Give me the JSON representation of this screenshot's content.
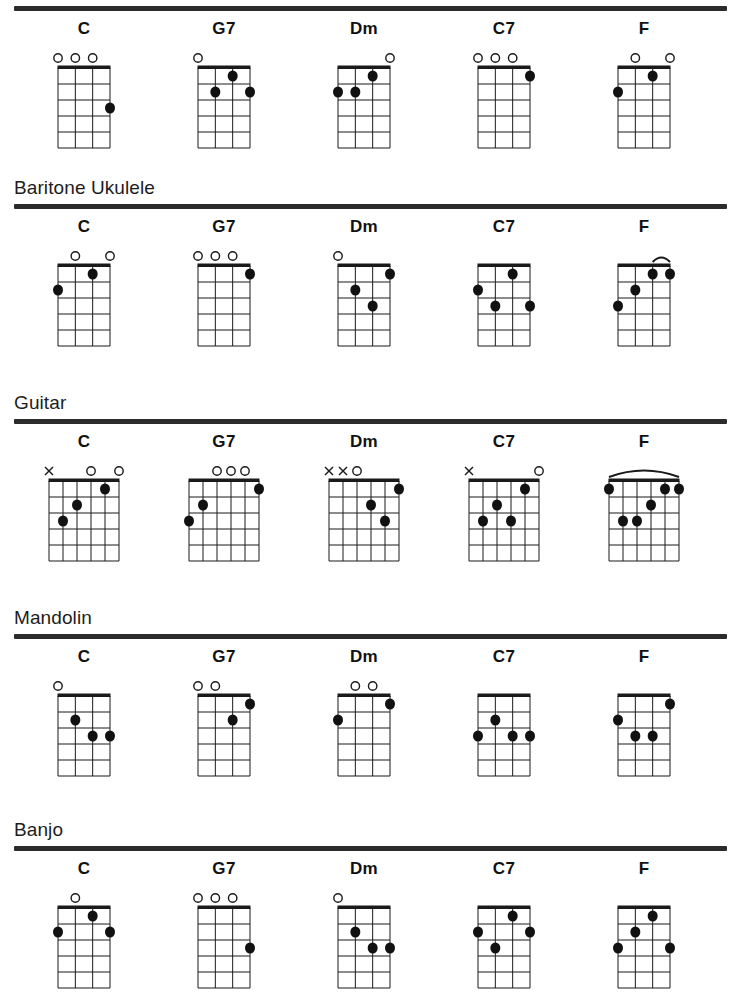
{
  "page": {
    "ink_color": "#1a1a1a",
    "paper_color": "#ffffff"
  },
  "markers": {
    "open_symbol": "O",
    "muted_symbol": "X",
    "open_name": "open-string-circle",
    "muted_name": "muted-string-cross",
    "barre_name": "barre-arc"
  },
  "chart_data": {
    "type": "table",
    "chords": [
      "C",
      "G7",
      "Dm",
      "C7",
      "F"
    ],
    "sections": [
      {
        "label": "",
        "show_label": false,
        "instrument": "Ukulele",
        "strings": 4,
        "frets": 5,
        "width": 52,
        "height": 80,
        "chords": [
          {
            "name": "C",
            "markers": [
              "o",
              "o",
              "o",
              ""
            ],
            "dots": [
              {
                "string": 4,
                "fret": 3
              }
            ],
            "barre": null
          },
          {
            "name": "G7",
            "markers": [
              "o",
              "",
              "",
              ""
            ],
            "dots": [
              {
                "string": 3,
                "fret": 1
              },
              {
                "string": 2,
                "fret": 2
              },
              {
                "string": 4,
                "fret": 2
              }
            ],
            "barre": null
          },
          {
            "name": "Dm",
            "markers": [
              "",
              "",
              "",
              "o"
            ],
            "dots": [
              {
                "string": 3,
                "fret": 1
              },
              {
                "string": 1,
                "fret": 2
              },
              {
                "string": 2,
                "fret": 2
              }
            ],
            "barre": null
          },
          {
            "name": "C7",
            "markers": [
              "o",
              "o",
              "o",
              ""
            ],
            "dots": [
              {
                "string": 4,
                "fret": 1
              }
            ],
            "barre": null
          },
          {
            "name": "F",
            "markers": [
              "",
              "o",
              "",
              "o"
            ],
            "dots": [
              {
                "string": 3,
                "fret": 1
              },
              {
                "string": 1,
                "fret": 2
              }
            ],
            "barre": null
          }
        ]
      },
      {
        "label": "Baritone Ukulele",
        "show_label": true,
        "instrument": "Baritone Ukulele",
        "strings": 4,
        "frets": 5,
        "width": 52,
        "height": 80,
        "chords": [
          {
            "name": "C",
            "markers": [
              "",
              "o",
              "",
              "o"
            ],
            "dots": [
              {
                "string": 3,
                "fret": 1
              },
              {
                "string": 1,
                "fret": 2
              }
            ],
            "barre": null
          },
          {
            "name": "G7",
            "markers": [
              "o",
              "o",
              "o",
              ""
            ],
            "dots": [
              {
                "string": 4,
                "fret": 1
              }
            ],
            "barre": null
          },
          {
            "name": "Dm",
            "markers": [
              "o",
              "",
              "",
              ""
            ],
            "dots": [
              {
                "string": 4,
                "fret": 1
              },
              {
                "string": 2,
                "fret": 2
              },
              {
                "string": 3,
                "fret": 3
              }
            ],
            "barre": null
          },
          {
            "name": "C7",
            "markers": [
              "",
              "",
              "",
              ""
            ],
            "dots": [
              {
                "string": 3,
                "fret": 1
              },
              {
                "string": 1,
                "fret": 2
              },
              {
                "string": 2,
                "fret": 3
              },
              {
                "string": 4,
                "fret": 3
              }
            ],
            "barre": null
          },
          {
            "name": "F",
            "markers": [
              "",
              "",
              "",
              ""
            ],
            "dots": [
              {
                "string": 3,
                "fret": 1
              },
              {
                "string": 4,
                "fret": 1
              },
              {
                "string": 2,
                "fret": 2
              },
              {
                "string": 1,
                "fret": 3
              }
            ],
            "barre": {
              "fret": 1,
              "from": 3,
              "to": 4
            }
          }
        ]
      },
      {
        "label": "Guitar",
        "show_label": true,
        "instrument": "Guitar",
        "strings": 6,
        "frets": 5,
        "width": 70,
        "height": 80,
        "chords": [
          {
            "name": "C",
            "markers": [
              "x",
              "",
              "",
              "o",
              "",
              "o"
            ],
            "dots": [
              {
                "string": 5,
                "fret": 1
              },
              {
                "string": 3,
                "fret": 2
              },
              {
                "string": 2,
                "fret": 3
              }
            ],
            "barre": null
          },
          {
            "name": "G7",
            "markers": [
              "",
              "",
              "o",
              "o",
              "o",
              ""
            ],
            "dots": [
              {
                "string": 6,
                "fret": 1
              },
              {
                "string": 2,
                "fret": 2
              },
              {
                "string": 1,
                "fret": 3
              }
            ],
            "barre": null
          },
          {
            "name": "Dm",
            "markers": [
              "x",
              "x",
              "o",
              "",
              "",
              ""
            ],
            "dots": [
              {
                "string": 6,
                "fret": 1
              },
              {
                "string": 4,
                "fret": 2
              },
              {
                "string": 5,
                "fret": 3
              }
            ],
            "barre": null
          },
          {
            "name": "C7",
            "markers": [
              "x",
              "",
              "",
              "",
              "",
              "o"
            ],
            "dots": [
              {
                "string": 5,
                "fret": 1
              },
              {
                "string": 3,
                "fret": 2
              },
              {
                "string": 2,
                "fret": 3
              },
              {
                "string": 4,
                "fret": 3
              }
            ],
            "barre": null
          },
          {
            "name": "F",
            "markers": [
              "",
              "",
              "",
              "",
              "",
              ""
            ],
            "dots": [
              {
                "string": 1,
                "fret": 1
              },
              {
                "string": 5,
                "fret": 1
              },
              {
                "string": 6,
                "fret": 1
              },
              {
                "string": 4,
                "fret": 2
              },
              {
                "string": 2,
                "fret": 3
              },
              {
                "string": 3,
                "fret": 3
              }
            ],
            "barre": {
              "fret": 1,
              "from": 1,
              "to": 6
            }
          }
        ]
      },
      {
        "label": "Mandolin",
        "show_label": true,
        "instrument": "Mandolin",
        "strings": 4,
        "frets": 5,
        "width": 52,
        "height": 80,
        "chords": [
          {
            "name": "C",
            "markers": [
              "o",
              "",
              "",
              ""
            ],
            "dots": [
              {
                "string": 2,
                "fret": 2
              },
              {
                "string": 3,
                "fret": 3
              },
              {
                "string": 4,
                "fret": 3
              }
            ],
            "barre": null
          },
          {
            "name": "G7",
            "markers": [
              "o",
              "o",
              "",
              ""
            ],
            "dots": [
              {
                "string": 4,
                "fret": 1
              },
              {
                "string": 3,
                "fret": 2
              }
            ],
            "barre": null
          },
          {
            "name": "Dm",
            "markers": [
              "",
              "o",
              "o",
              ""
            ],
            "dots": [
              {
                "string": 4,
                "fret": 1
              },
              {
                "string": 1,
                "fret": 2
              }
            ],
            "barre": null
          },
          {
            "name": "C7",
            "markers": [
              "",
              "",
              "",
              ""
            ],
            "dots": [
              {
                "string": 2,
                "fret": 2
              },
              {
                "string": 1,
                "fret": 3
              },
              {
                "string": 3,
                "fret": 3
              },
              {
                "string": 4,
                "fret": 3
              }
            ],
            "barre": null
          },
          {
            "name": "F",
            "markers": [
              "",
              "",
              "",
              ""
            ],
            "dots": [
              {
                "string": 4,
                "fret": 1
              },
              {
                "string": 1,
                "fret": 2
              },
              {
                "string": 2,
                "fret": 3
              },
              {
                "string": 3,
                "fret": 3
              }
            ],
            "barre": null
          }
        ]
      },
      {
        "label": "Banjo",
        "show_label": true,
        "instrument": "Banjo",
        "strings": 4,
        "frets": 5,
        "width": 52,
        "height": 80,
        "chords": [
          {
            "name": "C",
            "markers": [
              "",
              "o",
              "",
              ""
            ],
            "dots": [
              {
                "string": 3,
                "fret": 1
              },
              {
                "string": 1,
                "fret": 2
              },
              {
                "string": 4,
                "fret": 2
              }
            ],
            "barre": null
          },
          {
            "name": "G7",
            "markers": [
              "o",
              "o",
              "o",
              ""
            ],
            "dots": [
              {
                "string": 4,
                "fret": 3
              }
            ],
            "barre": null
          },
          {
            "name": "Dm",
            "markers": [
              "o",
              "",
              "",
              ""
            ],
            "dots": [
              {
                "string": 2,
                "fret": 2
              },
              {
                "string": 3,
                "fret": 3
              },
              {
                "string": 4,
                "fret": 3
              }
            ],
            "barre": null
          },
          {
            "name": "C7",
            "markers": [
              "",
              "",
              "",
              ""
            ],
            "dots": [
              {
                "string": 3,
                "fret": 1
              },
              {
                "string": 1,
                "fret": 2
              },
              {
                "string": 4,
                "fret": 2
              },
              {
                "string": 2,
                "fret": 3
              }
            ],
            "barre": null
          },
          {
            "name": "F",
            "markers": [
              "",
              "",
              "",
              ""
            ],
            "dots": [
              {
                "string": 3,
                "fret": 1
              },
              {
                "string": 2,
                "fret": 2
              },
              {
                "string": 1,
                "fret": 3
              },
              {
                "string": 4,
                "fret": 3
              }
            ],
            "barre": null
          }
        ]
      }
    ]
  }
}
